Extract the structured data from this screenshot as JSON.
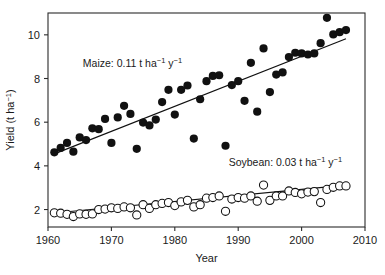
{
  "chart_data": {
    "type": "scatter",
    "title": "",
    "xlabel": "Year",
    "ylabel": "Yield (t ha−1)",
    "ylabel_parts": {
      "base": "Yield (t ha",
      "sup": "−1",
      "tail": ")"
    },
    "xlim": [
      1960,
      2010
    ],
    "ylim": [
      1.2,
      11.0
    ],
    "xticks": [
      1960,
      1970,
      1980,
      1990,
      2000,
      2010
    ],
    "yticks": [
      2,
      4,
      6,
      8,
      10
    ],
    "grid": false,
    "legend_position": "inline-annotation",
    "annotations": [
      {
        "name": "maize-rate-label",
        "text": "Maize: 0.11 t ha−1 y−1",
        "parts": {
          "lead": "Maize: 0.11 t ha",
          "sup1": "−1",
          "mid": " y",
          "sup2": "−1"
        },
        "x": 1965.5,
        "y": 8.55
      },
      {
        "name": "soybean-rate-label",
        "text": "Soybean: 0.03 t ha−1 y−1",
        "parts": {
          "lead": "Soybean: 0.03 t ha",
          "sup1": "−1",
          "mid": " y",
          "sup2": "−1"
        },
        "x": 1988.5,
        "y": 4.0
      }
    ],
    "series": [
      {
        "name": "Maize",
        "marker": "filled-circle",
        "color": "#111111",
        "marker_size": 4.1,
        "trend_rate": 0.11,
        "trend_units": "t ha-1 y-1",
        "trendline": {
          "x": [
            1961,
            2007
          ],
          "y": [
            4.55,
            9.82
          ]
        },
        "points": [
          {
            "x": 1961,
            "y": 4.62
          },
          {
            "x": 1962,
            "y": 4.82
          },
          {
            "x": 1963,
            "y": 5.05
          },
          {
            "x": 1964,
            "y": 4.65
          },
          {
            "x": 1965,
            "y": 5.3
          },
          {
            "x": 1966,
            "y": 5.18
          },
          {
            "x": 1967,
            "y": 5.72
          },
          {
            "x": 1968,
            "y": 5.68
          },
          {
            "x": 1969,
            "y": 6.15
          },
          {
            "x": 1970,
            "y": 5.05
          },
          {
            "x": 1971,
            "y": 6.22
          },
          {
            "x": 1972,
            "y": 6.75
          },
          {
            "x": 1973,
            "y": 6.38
          },
          {
            "x": 1974,
            "y": 4.78
          },
          {
            "x": 1975,
            "y": 5.98
          },
          {
            "x": 1976,
            "y": 5.85
          },
          {
            "x": 1977,
            "y": 6.12
          },
          {
            "x": 1978,
            "y": 6.92
          },
          {
            "x": 1979,
            "y": 7.48
          },
          {
            "x": 1980,
            "y": 6.35
          },
          {
            "x": 1981,
            "y": 7.48
          },
          {
            "x": 1982,
            "y": 7.68
          },
          {
            "x": 1983,
            "y": 5.25
          },
          {
            "x": 1984,
            "y": 7.05
          },
          {
            "x": 1985,
            "y": 7.88
          },
          {
            "x": 1986,
            "y": 8.12
          },
          {
            "x": 1987,
            "y": 8.15
          },
          {
            "x": 1988,
            "y": 4.92
          },
          {
            "x": 1989,
            "y": 7.7
          },
          {
            "x": 1990,
            "y": 7.88
          },
          {
            "x": 1991,
            "y": 6.98
          },
          {
            "x": 1992,
            "y": 8.72
          },
          {
            "x": 1993,
            "y": 6.48
          },
          {
            "x": 1994,
            "y": 9.38
          },
          {
            "x": 1995,
            "y": 7.38
          },
          {
            "x": 1996,
            "y": 8.18
          },
          {
            "x": 1997,
            "y": 8.28
          },
          {
            "x": 1998,
            "y": 8.98
          },
          {
            "x": 1999,
            "y": 9.18
          },
          {
            "x": 2000,
            "y": 9.15
          },
          {
            "x": 2001,
            "y": 9.1
          },
          {
            "x": 2002,
            "y": 9.15
          },
          {
            "x": 2003,
            "y": 9.62
          },
          {
            "x": 2004,
            "y": 10.78
          },
          {
            "x": 2005,
            "y": 10.02
          },
          {
            "x": 2006,
            "y": 10.12
          },
          {
            "x": 2007,
            "y": 10.22
          }
        ]
      },
      {
        "name": "Soybean",
        "marker": "open-circle",
        "color": "#111111",
        "marker_size": 4.1,
        "trend_rate": 0.03,
        "trend_units": "t ha-1 y-1",
        "trendline": {
          "x": [
            1961,
            2007
          ],
          "y": [
            1.84,
            3.12
          ]
        },
        "points": [
          {
            "x": 1961,
            "y": 1.85
          },
          {
            "x": 1962,
            "y": 1.83
          },
          {
            "x": 1963,
            "y": 1.78
          },
          {
            "x": 1964,
            "y": 1.68
          },
          {
            "x": 1965,
            "y": 1.8
          },
          {
            "x": 1966,
            "y": 1.78
          },
          {
            "x": 1967,
            "y": 1.8
          },
          {
            "x": 1968,
            "y": 2.0
          },
          {
            "x": 1969,
            "y": 2.02
          },
          {
            "x": 1970,
            "y": 2.08
          },
          {
            "x": 1971,
            "y": 2.05
          },
          {
            "x": 1972,
            "y": 2.12
          },
          {
            "x": 1973,
            "y": 2.08
          },
          {
            "x": 1974,
            "y": 1.75
          },
          {
            "x": 1975,
            "y": 2.22
          },
          {
            "x": 1976,
            "y": 2.05
          },
          {
            "x": 1977,
            "y": 2.22
          },
          {
            "x": 1978,
            "y": 2.28
          },
          {
            "x": 1979,
            "y": 2.32
          },
          {
            "x": 1980,
            "y": 2.18
          },
          {
            "x": 1981,
            "y": 2.35
          },
          {
            "x": 1982,
            "y": 2.42
          },
          {
            "x": 1983,
            "y": 2.12
          },
          {
            "x": 1984,
            "y": 2.22
          },
          {
            "x": 1985,
            "y": 2.52
          },
          {
            "x": 1986,
            "y": 2.55
          },
          {
            "x": 1987,
            "y": 2.62
          },
          {
            "x": 1988,
            "y": 1.92
          },
          {
            "x": 1989,
            "y": 2.48
          },
          {
            "x": 1990,
            "y": 2.55
          },
          {
            "x": 1991,
            "y": 2.52
          },
          {
            "x": 1992,
            "y": 2.62
          },
          {
            "x": 1993,
            "y": 2.38
          },
          {
            "x": 1994,
            "y": 3.12
          },
          {
            "x": 1995,
            "y": 2.42
          },
          {
            "x": 1996,
            "y": 2.62
          },
          {
            "x": 1997,
            "y": 2.62
          },
          {
            "x": 1998,
            "y": 2.85
          },
          {
            "x": 1999,
            "y": 2.78
          },
          {
            "x": 2000,
            "y": 2.72
          },
          {
            "x": 2001,
            "y": 2.8
          },
          {
            "x": 2002,
            "y": 2.82
          },
          {
            "x": 2003,
            "y": 2.32
          },
          {
            "x": 2004,
            "y": 2.92
          },
          {
            "x": 2005,
            "y": 3.02
          },
          {
            "x": 2006,
            "y": 3.08
          },
          {
            "x": 2007,
            "y": 3.08
          }
        ]
      }
    ]
  }
}
